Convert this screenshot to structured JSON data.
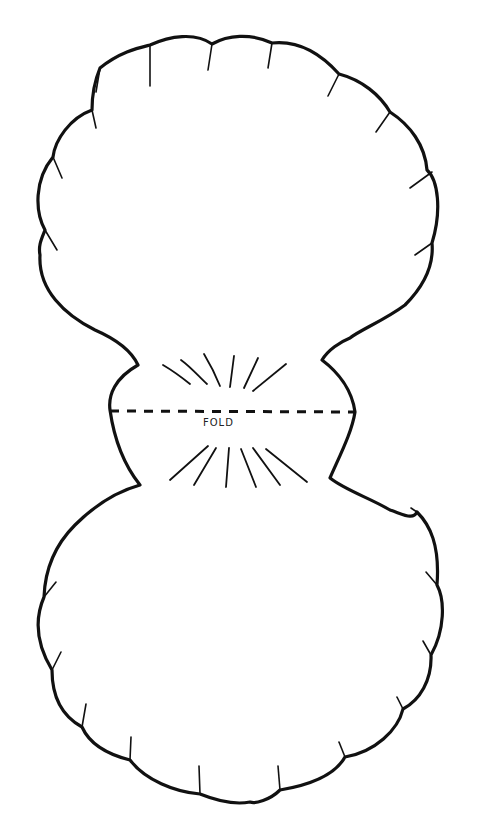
{
  "template": {
    "subject": "scallop-shell-card",
    "fold_label": "FOLD",
    "colors": {
      "background": "#ffffff",
      "ink": "#111111"
    }
  }
}
